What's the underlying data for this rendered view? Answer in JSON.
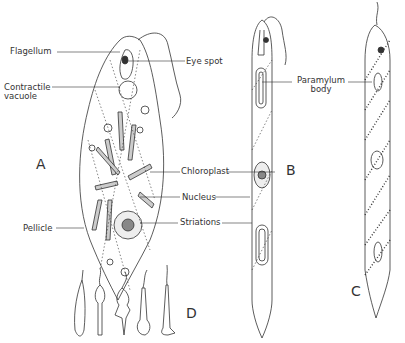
{
  "diagram": {
    "panels": [
      {
        "id": "A",
        "letter": "A"
      },
      {
        "id": "B",
        "letter": "B"
      },
      {
        "id": "C",
        "letter": "C"
      },
      {
        "id": "D",
        "letter": "D"
      }
    ],
    "labels": {
      "flagellum": "Flagellum",
      "eye_spot": "Eye spot",
      "contractile_vacuole_1": "Contractile",
      "contractile_vacuole_2": "vacuole",
      "paramylum_1": "Paramylum",
      "paramylum_2": "body",
      "chloroplast": "Chloroplast",
      "nucleus": "Nucleus",
      "striations": "Striations",
      "pellicle": "Pellicle"
    },
    "colors": {
      "line": "#333333",
      "background": "#ffffff"
    }
  }
}
